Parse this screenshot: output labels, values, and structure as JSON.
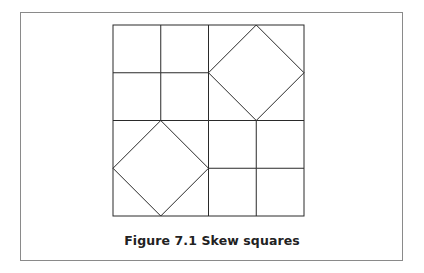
{
  "figure": {
    "caption": "Figure 7.1  Skew squares",
    "line_color": "#2a2a2a",
    "frame_color": "#8a8a8a",
    "grid": {
      "rows": 4,
      "cols": 4,
      "skew_blocks": [
        {
          "row": 0,
          "col": 2,
          "size": 2
        },
        {
          "row": 2,
          "col": 0,
          "size": 2
        }
      ]
    }
  }
}
